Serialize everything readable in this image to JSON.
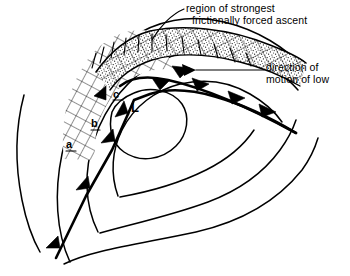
{
  "figure": {
    "type": "synoptic-weather-diagram",
    "background_color": "#ffffff",
    "line_color": "#000000"
  },
  "annotations": [
    {
      "name": "region-of-ascent",
      "line1": "region of strongest",
      "line2": "frictionally forced ascent"
    },
    {
      "name": "direction-of-motion",
      "line1": "direction of",
      "line2": "motion of low"
    }
  ],
  "labels": {
    "isobar_a": "a",
    "isobar_b": "b",
    "isobar_c": "c",
    "low_center": "L"
  },
  "legend_semantics": {
    "cross_hatched": "grid hatching west of low",
    "stippled": "dotted band of strongest ascent",
    "front_barbs": "filled triangles on frontal boundary"
  }
}
